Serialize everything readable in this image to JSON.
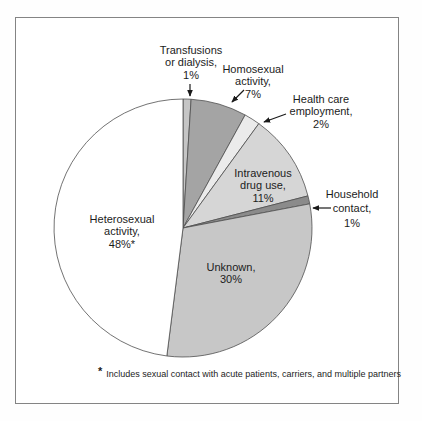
{
  "chart_data": {
    "type": "pie",
    "title": "",
    "direction": "clockwise",
    "start_angle_deg": 0,
    "legend": false,
    "slices": [
      {
        "label": "Transfusions or dialysis",
        "value": 1,
        "pct": "1%",
        "color": "#c5c5c5",
        "label_lines": [
          "Transfusions",
          "or dialysis,",
          "1%"
        ],
        "label_placement": "outside-arrow"
      },
      {
        "label": "Homosexual activity",
        "value": 7,
        "pct": "7%",
        "color": "#a4a4a4",
        "label_lines": [
          "Homosexual",
          "activity,",
          "7%"
        ],
        "label_placement": "outside-arrow"
      },
      {
        "label": "Health care employment",
        "value": 2,
        "pct": "2%",
        "color": "#ebebeb",
        "label_lines": [
          "Health care",
          "employment,",
          "2%"
        ],
        "label_placement": "outside-arrow"
      },
      {
        "label": "Intravenous drug use",
        "value": 11,
        "pct": "11%",
        "color": "#d6d6d6",
        "label_lines": [
          "Intravenous",
          "drug use,",
          "11%"
        ],
        "label_placement": "inside"
      },
      {
        "label": "Household contact",
        "value": 1,
        "pct": "1%",
        "color": "#8b8b8b",
        "label_lines": [
          "Household",
          "contact,",
          "1%"
        ],
        "label_placement": "outside-arrow"
      },
      {
        "label": "Unknown",
        "value": 30,
        "pct": "30%",
        "color": "#c7c7c7",
        "label_lines": [
          "Unknown,",
          "30%"
        ],
        "label_placement": "inside"
      },
      {
        "label": "Heterosexual activity",
        "value": 48,
        "pct": "48%*",
        "color": "#ffffff",
        "label_lines": [
          "Heterosexual",
          "activity,",
          "48%*"
        ],
        "label_placement": "inside"
      }
    ],
    "footnote_marker": "*",
    "footnote_text": "Includes sexual contact with acute patients, carriers, and multiple partners"
  },
  "colors": {
    "slice_stroke": "#4f4f4f",
    "arrow": "#1a1a1a",
    "text": "#1c1c1c",
    "frame_border": "#848484",
    "background": "#ffffff"
  }
}
